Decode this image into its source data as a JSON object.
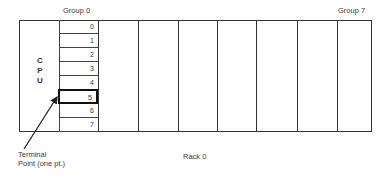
{
  "diagram": {
    "group_first_label": "Group 0",
    "group_last_label": "Group 7",
    "cpu_letters": [
      "C",
      "P",
      "U"
    ],
    "slots": [
      "0",
      "1",
      "2",
      "3",
      "4",
      "5",
      "6",
      "7"
    ],
    "highlighted_slot": "5",
    "rack_label": "Rack 0",
    "callout_line1": "Terminal",
    "callout_line2": "Point (one pt.)",
    "group_count": 8,
    "line_color": "#333333"
  }
}
